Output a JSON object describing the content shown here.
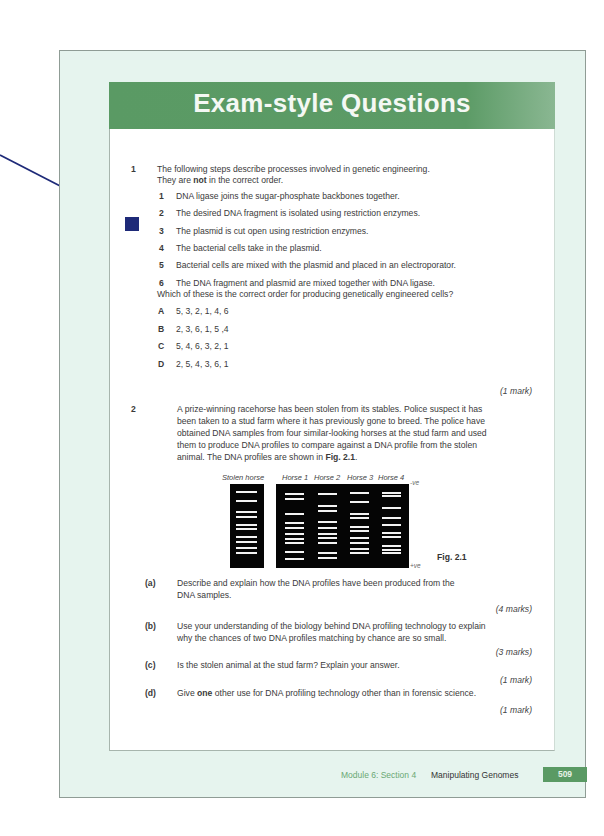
{
  "header": {
    "title": "Exam-style Questions"
  },
  "question1": {
    "number": "1",
    "intro_line1": "The following steps describe processes involved in genetic engineering.",
    "intro_line2_pre": "They are ",
    "intro_line2_bold": "not",
    "intro_line2_post": " in the correct order.",
    "steps": [
      {
        "num": "1",
        "text": "DNA ligase joins the sugar-phosphate backbones together."
      },
      {
        "num": "2",
        "text": "The desired DNA fragment is isolated using restriction enzymes."
      },
      {
        "num": "3",
        "text": "The plasmid is cut open using restriction enzymes."
      },
      {
        "num": "4",
        "text": "The bacterial cells take in the plasmid."
      },
      {
        "num": "5",
        "text": "Bacterial cells are mixed with the plasmid and placed in an electroporator."
      },
      {
        "num": "6",
        "text": "The DNA fragment and plasmid are mixed together with DNA ligase."
      }
    ],
    "prompt": "Which of these is the correct order for producing genetically engineered cells?",
    "options": [
      {
        "letter": "A",
        "text": "5, 3, 2, 1, 4, 6"
      },
      {
        "letter": "B",
        "text": "2, 3, 6, 1, 5 ,4"
      },
      {
        "letter": "C",
        "text": "5, 4, 6, 3, 2, 1"
      },
      {
        "letter": "D",
        "text": "2, 5, 4, 3, 6, 1"
      }
    ],
    "marks": "(1 mark)"
  },
  "question2": {
    "number": "2",
    "lines": [
      "A prize-winning racehorse has been stolen from its stables.  Police suspect it has",
      "been taken to a stud farm where it has previously gone to breed.  The police have",
      "obtained DNA samples from four similar-looking horses at the stud farm and used",
      "them to produce DNA profiles to compare against a DNA profile from the stolen"
    ],
    "last_line_pre": "animal.  The DNA profiles are shown in ",
    "last_line_bold": "Fig. 2.1",
    "last_line_post": ".",
    "figure": {
      "label": "Fig. 2.1",
      "negative_pole": "-ve",
      "positive_pole": "+ve",
      "lanes": [
        {
          "name": "Stolen horse",
          "bands": [
            0.05,
            0.17,
            0.31,
            0.38,
            0.49,
            0.54,
            0.64,
            0.71,
            0.79,
            0.85
          ]
        },
        {
          "name": "Horse 1",
          "bands": [
            0.08,
            0.14,
            0.34,
            0.46,
            0.52,
            0.61,
            0.67,
            0.72,
            0.84,
            0.93
          ]
        },
        {
          "name": "Horse 2",
          "bands": [
            0.08,
            0.24,
            0.3,
            0.45,
            0.52,
            0.6,
            0.66,
            0.72,
            0.86,
            0.92
          ]
        },
        {
          "name": "Horse 3",
          "bands": [
            0.06,
            0.18,
            0.34,
            0.4,
            0.51,
            0.56,
            0.66,
            0.73,
            0.8,
            0.86
          ]
        },
        {
          "name": "Horse 4",
          "bands": [
            0.06,
            0.11,
            0.26,
            0.39,
            0.49,
            0.59,
            0.64,
            0.76,
            0.81,
            0.86
          ]
        }
      ]
    },
    "parts": [
      {
        "label": "(a)",
        "lines": [
          "Describe and explain how the DNA profiles have been produced from the",
          "DNA samples."
        ],
        "marks": "(4 marks)"
      },
      {
        "label": "(b)",
        "lines": [
          "Use your understanding of the biology behind DNA profiling technology to explain",
          "why the chances of two DNA profiles matching by chance are so small."
        ],
        "marks": "(3 marks)"
      },
      {
        "label": "(c)",
        "lines": [
          "Is the stolen animal at the stud farm?  Explain your answer."
        ],
        "marks": "(1 mark)"
      },
      {
        "label": "(d)",
        "pre": "Give ",
        "bold": "one",
        "post": " other use for DNA profiling technology other than in forensic science.",
        "marks": "(1 mark)"
      }
    ]
  },
  "footer": {
    "module": "Module 6: Section 4",
    "section": "Manipulating Genomes",
    "page_number": "509"
  },
  "colors": {
    "header_green": "#5a9a64",
    "page_background": "#e6f4ee",
    "annotation_marker": "#1e2a78"
  }
}
